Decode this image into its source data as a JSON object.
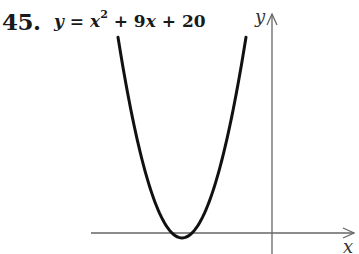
{
  "problem": {
    "number": "45.",
    "equation": {
      "lhs": "y",
      "equals": " = ",
      "term1_var": "x",
      "term1_exp": "2",
      "rest_plus1": " + 9",
      "rest_var": "x",
      "rest_plus2": " + 20"
    },
    "equation_text": "y = x^2 + 9x + 20"
  },
  "axes": {
    "x_label": "x",
    "y_label": "y",
    "axis_color": "#666666",
    "curve_color": "#111111"
  },
  "chart_data": {
    "type": "line",
    "xlabel": "x",
    "ylabel": "y",
    "function": "x^2 + 9x + 20",
    "vertex": [
      -4.5,
      -0.25
    ],
    "roots": [
      -5,
      -4
    ],
    "y_intercept": 20,
    "x": [
      -7.7,
      -7.0,
      -6.5,
      -6.0,
      -5.5,
      -5.0,
      -4.75,
      -4.5,
      -4.25,
      -4.0,
      -3.5,
      -3.0,
      -2.5,
      -2.0,
      -1.3
    ],
    "y": [
      10.0,
      6.0,
      3.75,
      2.0,
      0.75,
      0.0,
      -0.1875,
      -0.25,
      -0.1875,
      0.0,
      0.75,
      2.0,
      3.75,
      6.0,
      10.0
    ],
    "xlim": [
      -9.0,
      4.2
    ],
    "ylim": [
      -1.0,
      11.0
    ],
    "grid": false,
    "tick_labels": false,
    "legend": "none"
  }
}
